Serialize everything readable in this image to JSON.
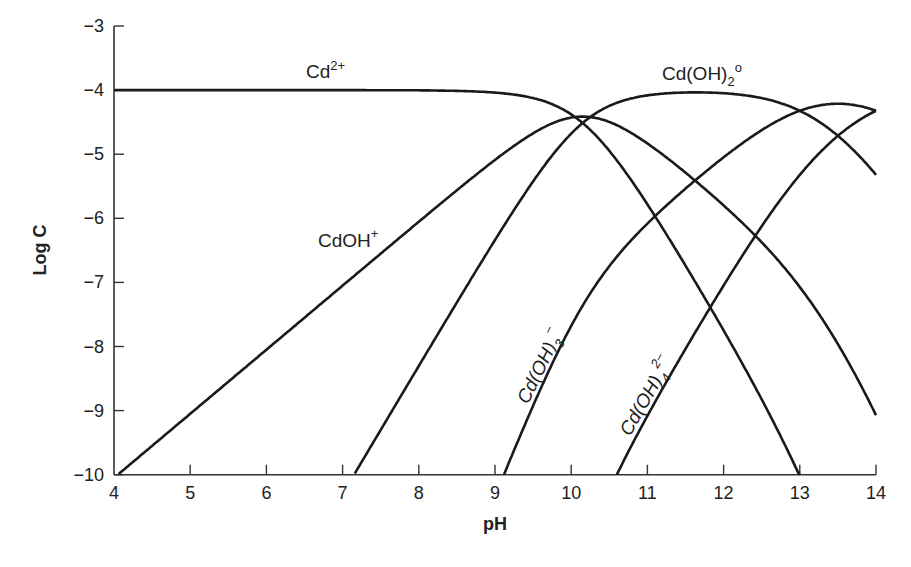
{
  "chart_data": {
    "type": "line",
    "title": "",
    "xlabel": "pH",
    "ylabel": "Log C",
    "xlim": [
      4,
      14
    ],
    "ylim": [
      -10,
      -3
    ],
    "x_ticks": [
      "4",
      "5",
      "6",
      "7",
      "8",
      "9",
      "10",
      "11",
      "12",
      "13",
      "14"
    ],
    "y_ticks": [
      "−3",
      "−4",
      "−5",
      "−6",
      "−7",
      "−8",
      "−9",
      "−10"
    ],
    "grid": false,
    "legend": "inline labels",
    "total_log_C": -4,
    "series": [
      {
        "name": "Cd2+",
        "label_main": "Cd",
        "label_sup": "2+",
        "log_k": 0,
        "n": 0,
        "points": [
          [
            4,
            -4
          ],
          [
            8,
            -4.0
          ],
          [
            9,
            -4.07
          ],
          [
            10,
            -4.5
          ],
          [
            11,
            -5.6
          ],
          [
            12,
            -7.5
          ],
          [
            13,
            -10
          ]
        ]
      },
      {
        "name": "CdOH+",
        "label_main": "CdOH",
        "label_sup": "+",
        "log_k": -10.05,
        "n": 1,
        "points": [
          [
            4,
            -10
          ],
          [
            6,
            -8
          ],
          [
            8,
            -6
          ],
          [
            9,
            -5.1
          ],
          [
            10,
            -4.45
          ],
          [
            11,
            -4.6
          ],
          [
            12,
            -5.5
          ],
          [
            13,
            -7.0
          ],
          [
            14,
            -9.05
          ]
        ]
      },
      {
        "name": "Cd(OH)2o",
        "label_main": "Cd(OH)",
        "label_sub": "2",
        "label_sup": "o",
        "log_k": -20.3,
        "n": 2,
        "points": [
          [
            7.2,
            -10
          ],
          [
            8,
            -8.4
          ],
          [
            9,
            -6.4
          ],
          [
            10,
            -4.6
          ],
          [
            11,
            -4.05
          ],
          [
            11.6,
            -4.0
          ],
          [
            12,
            -4.1
          ],
          [
            13,
            -4.5
          ],
          [
            14,
            -5.3
          ]
        ]
      },
      {
        "name": "Cd(OH)3-",
        "label_main": "Cd(OH)",
        "label_sub": "3",
        "label_sup": "−",
        "log_k": -33.3,
        "n": 3,
        "points": [
          [
            9.1,
            -10
          ],
          [
            10,
            -7.5
          ],
          [
            11,
            -5.6
          ],
          [
            12,
            -4.6
          ],
          [
            13,
            -4.2
          ],
          [
            13.5,
            -4.15
          ],
          [
            14,
            -4.28
          ]
        ]
      },
      {
        "name": "Cd(OH)4 2-",
        "label_main": "Cd(OH)",
        "label_sub": "4",
        "label_sup": "2−",
        "log_k": -47.3,
        "n": 4,
        "points": [
          [
            10.6,
            -10
          ],
          [
            11,
            -8.6
          ],
          [
            12,
            -6.5
          ],
          [
            13,
            -5.0
          ],
          [
            14,
            -4.3
          ]
        ]
      }
    ],
    "labels": {
      "cd2": "Cd",
      "cd2_sup": "2+",
      "cdoh": "CdOH",
      "cdoh_sup": "+",
      "cdoh2": "Cd(OH)",
      "cdoh2_sub": "2",
      "cdoh2_sup": "o",
      "cdoh3": "Cd(OH)",
      "cdoh3_sub": "3",
      "cdoh3_sup": "−",
      "cdoh4": "Cd(OH)",
      "cdoh4_sub": "4",
      "cdoh4_sup": "2−"
    }
  }
}
